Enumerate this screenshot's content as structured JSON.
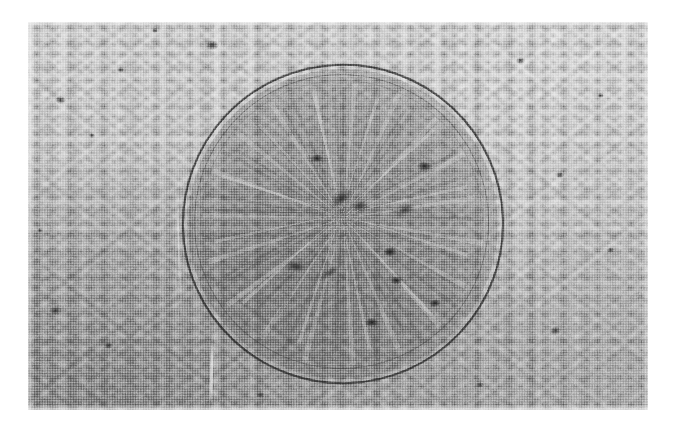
{
  "figure": {
    "kind": "micrograph",
    "medium": "halftone-printed grayscale photograph",
    "caption": "",
    "plate": {
      "x": 28,
      "y": 22,
      "width": 620,
      "height": 388,
      "page_background": "#ffffff",
      "base_tone": "#c2c2c2",
      "darkest_tone": "#4a4a4a",
      "lightest_tone": "#f2f2f2"
    },
    "background_texture": {
      "description": "fine granular halftone with faint vertical streaking; tone darkens toward the lower-left corner",
      "grain_scale_px": 2.6,
      "streak_direction": "vertical"
    },
    "feature": {
      "name": "circular-indentation",
      "shape": "circle",
      "center_x": 343,
      "center_y": 224,
      "radius": 161,
      "interior": "darker, coarsely mottled",
      "rings": [
        {
          "name": "outer-ring",
          "radius": 161,
          "stroke": "#1c1c1c",
          "thickness_px": 2
        },
        {
          "name": "inner-ring",
          "radius": 147,
          "stroke": "#373737",
          "thickness_px": 1.5
        },
        {
          "name": "inner-ring-faint",
          "radius": 140,
          "stroke": "#5a5a5a",
          "thickness_px": 1
        }
      ],
      "radial_pattern": "light streaks radiating from the centre forming a star / crack-like figure",
      "dark_clusters": [
        {
          "x": 341,
          "y": 199,
          "w": 26,
          "h": 14
        },
        {
          "x": 360,
          "y": 206,
          "w": 18,
          "h": 12
        },
        {
          "x": 405,
          "y": 209,
          "w": 20,
          "h": 11
        },
        {
          "x": 296,
          "y": 266,
          "w": 24,
          "h": 11
        },
        {
          "x": 330,
          "y": 272,
          "w": 20,
          "h": 9
        },
        {
          "x": 390,
          "y": 252,
          "w": 14,
          "h": 10
        },
        {
          "x": 396,
          "y": 280,
          "w": 13,
          "h": 9
        },
        {
          "x": 435,
          "y": 303,
          "w": 12,
          "h": 8
        },
        {
          "x": 424,
          "y": 166,
          "w": 15,
          "h": 10
        },
        {
          "x": 317,
          "y": 158,
          "w": 14,
          "h": 9
        },
        {
          "x": 372,
          "y": 322,
          "w": 14,
          "h": 9
        }
      ]
    },
    "background_specks": [
      {
        "x": 212,
        "y": 45,
        "w": 14,
        "h": 10
      },
      {
        "x": 60,
        "y": 100,
        "w": 11,
        "h": 8
      },
      {
        "x": 120,
        "y": 70,
        "w": 7,
        "h": 6
      },
      {
        "x": 92,
        "y": 135,
        "w": 6,
        "h": 5
      },
      {
        "x": 55,
        "y": 310,
        "w": 13,
        "h": 9
      },
      {
        "x": 108,
        "y": 345,
        "w": 9,
        "h": 7
      },
      {
        "x": 520,
        "y": 60,
        "w": 9,
        "h": 7
      },
      {
        "x": 560,
        "y": 175,
        "w": 8,
        "h": 6
      },
      {
        "x": 555,
        "y": 330,
        "w": 11,
        "h": 9
      },
      {
        "x": 610,
        "y": 250,
        "w": 7,
        "h": 6
      },
      {
        "x": 480,
        "y": 385,
        "w": 8,
        "h": 6
      },
      {
        "x": 260,
        "y": 395,
        "w": 9,
        "h": 6
      },
      {
        "x": 155,
        "y": 30,
        "w": 6,
        "h": 5
      },
      {
        "x": 600,
        "y": 95,
        "w": 7,
        "h": 5
      },
      {
        "x": 40,
        "y": 230,
        "w": 6,
        "h": 5
      }
    ]
  }
}
